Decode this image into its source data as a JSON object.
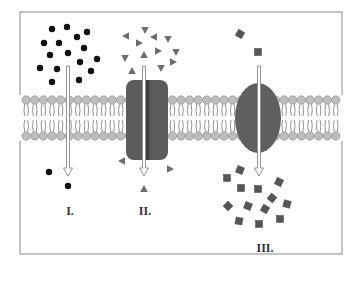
{
  "figure": {
    "type": "membrane-transport-diagram",
    "labels": [
      {
        "id": "I",
        "text": "I.",
        "x": 70,
        "y": 215
      },
      {
        "id": "II",
        "text": "II.",
        "x": 145,
        "y": 215
      },
      {
        "id": "III",
        "text": "III.",
        "x": 265,
        "y": 252
      }
    ]
  },
  "colors": {
    "frame": "#888888",
    "lipid_head": "#bdbdbd",
    "lipid_head_stroke": "#8a8a8a",
    "lipid_tail": "#777777",
    "channel_protein": "#5c5c5c",
    "carrier_protein": "#5f5f5f",
    "dot": "#111111",
    "triangle": "#6e6e6e",
    "square": "#555555",
    "arrow_fill": "#ffffff",
    "arrow_stroke": "#888888"
  },
  "frame": {
    "x": 20,
    "y": 12,
    "width": 322,
    "height": 242
  },
  "membrane": {
    "top_head_y": 100,
    "bottom_head_y": 136,
    "x_start": 22,
    "x_end": 342,
    "head_spacing": 8.6,
    "head_r": 4.2
  },
  "proteins": {
    "channel": {
      "x": 126,
      "y": 80,
      "width": 42,
      "height": 80,
      "gap_x": 147
    },
    "carrier": {
      "cx": 258,
      "cy": 118,
      "rx": 23,
      "ry": 35
    }
  },
  "arrows": [
    {
      "name": "arrow-I",
      "x": 68,
      "y1": 66,
      "y2": 176
    },
    {
      "name": "arrow-II",
      "x": 144,
      "y1": 66,
      "y2": 176
    },
    {
      "name": "arrow-III",
      "x": 259,
      "y1": 66,
      "y2": 176
    }
  ],
  "particles": {
    "dots": [
      [
        52,
        29
      ],
      [
        67,
        27
      ],
      [
        77,
        37
      ],
      [
        87,
        32
      ],
      [
        44,
        43
      ],
      [
        59,
        43
      ],
      [
        84,
        48
      ],
      [
        50,
        55
      ],
      [
        68,
        53
      ],
      [
        97,
        59
      ],
      [
        80,
        62
      ],
      [
        40,
        68
      ],
      [
        57,
        69
      ],
      [
        91,
        71
      ],
      [
        52,
        82
      ],
      [
        79,
        80
      ],
      [
        49,
        172
      ],
      [
        68,
        186
      ]
    ],
    "triangles": [
      {
        "x": 145,
        "y": 30,
        "r": 180
      },
      {
        "x": 126,
        "y": 36,
        "r": -90
      },
      {
        "x": 154,
        "y": 37,
        "r": -90
      },
      {
        "x": 168,
        "y": 39,
        "r": 180
      },
      {
        "x": 139,
        "y": 43,
        "r": 90
      },
      {
        "x": 158,
        "y": 51,
        "r": 90
      },
      {
        "x": 176,
        "y": 52,
        "r": 180
      },
      {
        "x": 144,
        "y": 55,
        "r": 0
      },
      {
        "x": 125,
        "y": 58,
        "r": 180
      },
      {
        "x": 173,
        "y": 62,
        "r": 90
      },
      {
        "x": 161,
        "y": 68,
        "r": 180
      },
      {
        "x": 132,
        "y": 71,
        "r": 0
      },
      {
        "x": 122,
        "y": 161,
        "r": -90
      },
      {
        "x": 170,
        "y": 169,
        "r": 90
      },
      {
        "x": 144,
        "y": 189,
        "r": 0
      }
    ],
    "squares": [
      {
        "x": 240,
        "y": 34,
        "r": 30
      },
      {
        "x": 258,
        "y": 52,
        "r": 0
      },
      {
        "x": 240,
        "y": 170,
        "r": 20
      },
      {
        "x": 227,
        "y": 178,
        "r": 0
      },
      {
        "x": 241,
        "y": 188,
        "r": 0
      },
      {
        "x": 258,
        "y": 189,
        "r": 0
      },
      {
        "x": 279,
        "y": 182,
        "r": 25
      },
      {
        "x": 272,
        "y": 198,
        "r": 40
      },
      {
        "x": 228,
        "y": 206,
        "r": 45
      },
      {
        "x": 248,
        "y": 206,
        "r": 20
      },
      {
        "x": 265,
        "y": 209,
        "r": 30
      },
      {
        "x": 287,
        "y": 204,
        "r": 15
      },
      {
        "x": 239,
        "y": 221,
        "r": 10
      },
      {
        "x": 259,
        "y": 224,
        "r": 0
      },
      {
        "x": 280,
        "y": 219,
        "r": 0
      }
    ]
  }
}
